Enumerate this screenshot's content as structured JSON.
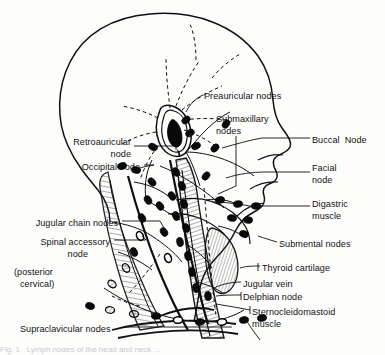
{
  "figure": {
    "background_color": "#fdfdfc",
    "ink_color": "#101010",
    "width": 385,
    "height": 355
  },
  "labels": [
    {
      "id": "preauricular",
      "text": "Preauricular nodes",
      "x": 204,
      "y": 97,
      "align": "left"
    },
    {
      "id": "submaxillary",
      "text": "Submaxillary",
      "x": 216,
      "y": 120,
      "align": "left"
    },
    {
      "id": "submaxillary2",
      "text": "nodes",
      "x": 216,
      "y": 132,
      "align": "left"
    },
    {
      "id": "buccal",
      "text": "Buccal  Node",
      "x": 312,
      "y": 141,
      "align": "left"
    },
    {
      "id": "facial",
      "text": "Facial",
      "x": 312,
      "y": 169,
      "align": "left"
    },
    {
      "id": "facial2",
      "text": "node",
      "x": 312,
      "y": 181,
      "align": "left"
    },
    {
      "id": "digastric",
      "text": "Digastric",
      "x": 312,
      "y": 205,
      "align": "left"
    },
    {
      "id": "digastric2",
      "text": "muscle",
      "x": 312,
      "y": 217,
      "align": "left"
    },
    {
      "id": "submental",
      "text": "Submental nodes",
      "x": 279,
      "y": 245,
      "align": "left"
    },
    {
      "id": "thyroid",
      "text": "Thyroid cartilage",
      "x": 262,
      "y": 269,
      "align": "left"
    },
    {
      "id": "jugularvein",
      "text": "Jugular vein",
      "x": 243,
      "y": 285,
      "align": "left"
    },
    {
      "id": "delphian",
      "text": "Delphian node",
      "x": 243,
      "y": 298,
      "align": "left"
    },
    {
      "id": "sternocleidomastoid",
      "text": "Sternocleidomastoid",
      "x": 252,
      "y": 313,
      "align": "left"
    },
    {
      "id": "sternocleidomastoid2",
      "text": "muscle",
      "x": 252,
      "y": 325,
      "align": "left"
    },
    {
      "id": "retroauricular",
      "text": "Retroauricular",
      "x": 131,
      "y": 143,
      "align": "right"
    },
    {
      "id": "retroauricular2",
      "text": "node",
      "x": 131,
      "y": 155,
      "align": "right"
    },
    {
      "id": "occipital",
      "text": "Occipital node",
      "x": 140,
      "y": 168,
      "align": "right"
    },
    {
      "id": "jugularchain",
      "text": "Jugular chain nodes",
      "x": 118,
      "y": 224,
      "align": "right"
    },
    {
      "id": "spinalaccessory",
      "text": "Spinal accessory",
      "x": 110,
      "y": 243,
      "align": "right"
    },
    {
      "id": "spinalaccessory2",
      "text": "node",
      "x": 88,
      "y": 255,
      "align": "right"
    },
    {
      "id": "posteriorcervical",
      "text": "(posterior",
      "x": 14,
      "y": 273,
      "align": "left"
    },
    {
      "id": "posteriorcervical2",
      "text": "cervical)",
      "x": 20,
      "y": 285,
      "align": "left"
    },
    {
      "id": "supraclavicular",
      "text": "Supraclavicular nodes",
      "x": 20,
      "y": 330,
      "align": "left"
    }
  ],
  "bottom_cut_text": "Fig. 1   Lymph nodes of the head and neck ..."
}
